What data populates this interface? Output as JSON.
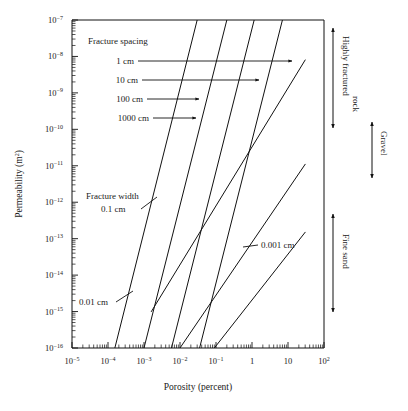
{
  "chart_data": {
    "type": "line",
    "title": "",
    "xlabel": "Porosity (percent)",
    "ylabel": "Permeability (m²)",
    "xscale": "log",
    "yscale": "log",
    "xlim": [
      1e-05,
      100
    ],
    "ylim": [
      1e-16,
      1e-07
    ],
    "grid": false,
    "legend_position": "inline-annotations",
    "x_tick_labels": [
      "10−5",
      "10−4",
      "10−3",
      "10−2",
      "10−1",
      "1",
      "10",
      "10²"
    ],
    "x_tick_values": [
      1e-05,
      0.0001,
      0.001,
      0.01,
      0.1,
      1,
      10,
      100
    ],
    "y_tick_labels": [
      "10−7",
      "10−8",
      "10−9",
      "10−10",
      "10−11",
      "10−12",
      "10−13",
      "10−14",
      "10−15",
      "10−16"
    ],
    "y_tick_values": [
      1e-07,
      1e-08,
      1e-09,
      1e-10,
      1e-11,
      1e-12,
      1e-13,
      1e-14,
      1e-15,
      1e-16
    ],
    "series": [
      {
        "name": "Fracture spacing 1 cm",
        "group": "fracture-spacing",
        "slope": 3,
        "points": [
          [
            0.000155,
            1e-16
          ],
          [
            0.03,
            1e-07
          ]
        ]
      },
      {
        "name": "Fracture spacing 10 cm",
        "group": "fracture-spacing",
        "slope": 3,
        "points": [
          [
            0.001,
            1e-16
          ],
          [
            0.2,
            1e-07
          ]
        ]
      },
      {
        "name": "Fracture spacing 100 cm",
        "group": "fracture-spacing",
        "slope": 3,
        "points": [
          [
            0.0058,
            1e-16
          ],
          [
            1.15,
            1e-07
          ]
        ]
      },
      {
        "name": "Fracture spacing 1000 cm",
        "group": "fracture-spacing",
        "slope": 3,
        "points": [
          [
            0.035,
            1e-16
          ],
          [
            7.0,
            1e-07
          ]
        ]
      },
      {
        "name": "Fracture width 0.1 cm",
        "group": "fracture-width",
        "slope": 1,
        "points": [
          [
            0.0016,
            1e-15
          ],
          [
            30,
            8e-09
          ]
        ]
      },
      {
        "name": "Fracture width 0.01 cm",
        "group": "fracture-width",
        "slope": 1,
        "points": [
          [
            0.01,
            1e-16
          ],
          [
            30,
            1.1e-11
          ]
        ]
      },
      {
        "name": "Fracture width 0.001 cm",
        "group": "fracture-width",
        "slope": 1,
        "points": [
          [
            0.09,
            1e-16
          ],
          [
            30,
            1.5e-13
          ]
        ]
      }
    ],
    "annotations": {
      "spacing_header": "Fracture spacing",
      "spacing_labels": [
        "1 cm",
        "10 cm",
        "100 cm",
        "1000 cm"
      ],
      "width_header": "Fracture width",
      "width_labels": [
        "0.1 cm",
        "0.01 cm",
        "0.001 cm"
      ],
      "side_ranges": [
        {
          "label": "Highly fractured rock",
          "from": 1e-07,
          "to": 1.1e-11
        },
        {
          "label": "Gravel",
          "from": 1.2e-10,
          "to": 3e-13
        },
        {
          "label": "Fine sand",
          "from": 3e-13,
          "to": 2e-16
        }
      ]
    }
  },
  "axes": {
    "x_title": "Porosity (percent)",
    "y_title_main": "Permeability (m",
    "y_title_sup": "2",
    "y_title_close": ")"
  },
  "ticks": {
    "x": [
      {
        "label_mantissa": "10",
        "label_exp": "−5"
      },
      {
        "label_mantissa": "10",
        "label_exp": "−4"
      },
      {
        "label_mantissa": "10",
        "label_exp": "−3"
      },
      {
        "label_mantissa": "10",
        "label_exp": "−2"
      },
      {
        "label_mantissa": "10",
        "label_exp": "−1"
      },
      {
        "label_mantissa": "1",
        "label_exp": ""
      },
      {
        "label_mantissa": "10",
        "label_exp": ""
      },
      {
        "label_mantissa": "10",
        "label_exp": "2"
      }
    ],
    "y": [
      {
        "label_mantissa": "10",
        "label_exp": "−7"
      },
      {
        "label_mantissa": "10",
        "label_exp": "−8"
      },
      {
        "label_mantissa": "10",
        "label_exp": "−9"
      },
      {
        "label_mantissa": "10",
        "label_exp": "−10"
      },
      {
        "label_mantissa": "10",
        "label_exp": "−11"
      },
      {
        "label_mantissa": "10",
        "label_exp": "−12"
      },
      {
        "label_mantissa": "10",
        "label_exp": "−13"
      },
      {
        "label_mantissa": "10",
        "label_exp": "−14"
      },
      {
        "label_mantissa": "10",
        "label_exp": "−15"
      },
      {
        "label_mantissa": "10",
        "label_exp": "−16"
      }
    ]
  },
  "labels": {
    "spacing_header": "Fracture spacing",
    "spacing_1": "1 cm",
    "spacing_10": "10 cm",
    "spacing_100": "100 cm",
    "spacing_1000": "1000 cm",
    "width_header": "Fracture width",
    "width_01": "0.1 cm",
    "width_001": "0.01 cm",
    "width_0001": "0.001 cm",
    "side_highly_fractured": "Highly fractured rock",
    "side_highly_fractured_l1": "Highly fractured",
    "side_highly_fractured_l2": "rock",
    "side_gravel": "Gravel",
    "side_fine_sand": "Fine sand"
  },
  "colors": {
    "ink": "#1a1a1a",
    "line": "#111111",
    "background": "#ffffff"
  }
}
